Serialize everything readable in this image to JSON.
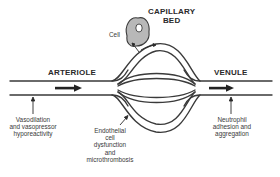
{
  "diagram": {
    "labels": {
      "capillary_bed": [
        "CAPILLARY",
        "BED"
      ],
      "cell": "Cell",
      "arteriole": "ARTERIOLE",
      "venule": "VENULE",
      "vasodilation": [
        "Vasodilation",
        "and vasopressor",
        "hyporeactivity"
      ],
      "endothelial": [
        "Endothelial",
        "cell",
        "dysfunction",
        "and",
        "microthrombosis"
      ],
      "neutrophil": [
        "Neutrophil",
        "adhesion and",
        "aggregation"
      ]
    },
    "colors": {
      "line": "#3a3a3a",
      "cell_fill": "#b8b8b8",
      "text": "#2a2a2a"
    }
  }
}
